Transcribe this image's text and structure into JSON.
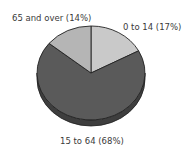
{
  "chart_data": {
    "type": "pie",
    "title": "",
    "style": "3d",
    "slices": [
      {
        "label": "0 to 14",
        "percent": 17,
        "display": "0 to 14 (17%)",
        "color": "#c9c9c9"
      },
      {
        "label": "15 to 64",
        "percent": 68,
        "display": "15 to 64 (68%)",
        "color": "#5a5a5a"
      },
      {
        "label": "65 and over",
        "percent": 14,
        "display": "65 and over (14%)",
        "color": "#b5b5b5"
      }
    ],
    "legend": "none (direct labels)"
  },
  "labels": {
    "age_0_14": "0 to 14 (17%)",
    "age_15_64": "15 to 64 (68%)",
    "age_65_over": "65 and over (14%)"
  }
}
